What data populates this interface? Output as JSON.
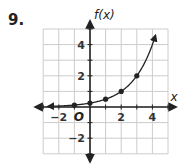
{
  "problem": {
    "number": "9."
  },
  "chart_data": {
    "type": "line",
    "title": "",
    "xlabel": "x",
    "ylabel": "f(x)",
    "origin_label": "O",
    "xlim": [
      -3,
      5
    ],
    "ylim": [
      -3,
      5
    ],
    "grid": true,
    "x_ticks": [
      -2,
      2,
      4
    ],
    "x_tick_labels": [
      "−2",
      "2",
      "4"
    ],
    "y_ticks": [
      4,
      2,
      -2
    ],
    "y_tick_labels": [
      "4",
      "2",
      "−2"
    ],
    "function": "f(x) = 0.25 * 2^x",
    "curve_domain": [
      -2.7,
      4.2
    ],
    "points": [
      {
        "x": -1,
        "y": 0.125
      },
      {
        "x": 0,
        "y": 0.25
      },
      {
        "x": 1,
        "y": 0.5
      },
      {
        "x": 2,
        "y": 1
      },
      {
        "x": 3,
        "y": 2
      }
    ],
    "colors": {
      "grid": "#cccccc",
      "axis": "#222222",
      "curve": "#222222"
    }
  }
}
